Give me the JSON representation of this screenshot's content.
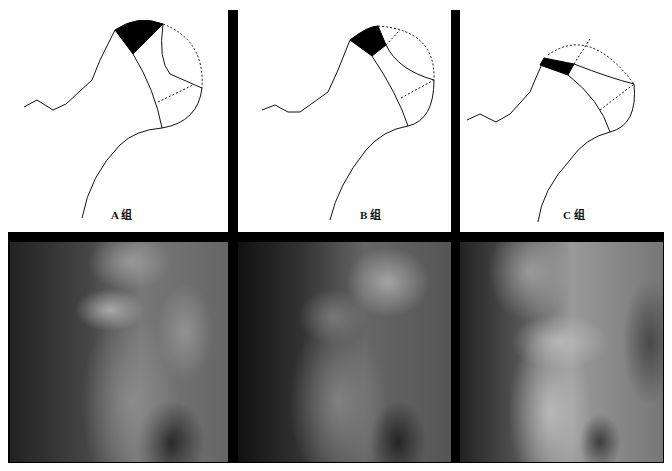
{
  "figure": {
    "diagrams": [
      {
        "id": "A",
        "label": "A 组"
      },
      {
        "id": "B",
        "label": "B 组"
      },
      {
        "id": "C",
        "label": "C 组"
      }
    ],
    "xrays": [
      {
        "id": "A",
        "description": "radiograph-group-a"
      },
      {
        "id": "B",
        "description": "radiograph-group-b"
      },
      {
        "id": "C",
        "description": "radiograph-group-c"
      }
    ],
    "colors": {
      "separator": "#000000",
      "background": "#ffffff",
      "line": "#111111"
    }
  }
}
